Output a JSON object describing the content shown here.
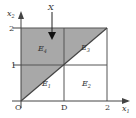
{
  "diagram": {
    "axes": {
      "x_label": "x",
      "x_label_sub": "1",
      "y_label": "x",
      "y_label_sub": "2",
      "origin_label": "O",
      "x_ticks": [
        "D",
        "2"
      ],
      "y_ticks": [
        "1",
        "2"
      ]
    },
    "arrow_label": "X",
    "regions": [
      {
        "name": "E",
        "sub": "4"
      },
      {
        "name": "E",
        "sub": "3"
      },
      {
        "name": "E",
        "sub": "1"
      },
      {
        "name": "E",
        "sub": "2"
      }
    ],
    "colors": {
      "shade": "#a8a8a8",
      "line": "#555555"
    }
  }
}
